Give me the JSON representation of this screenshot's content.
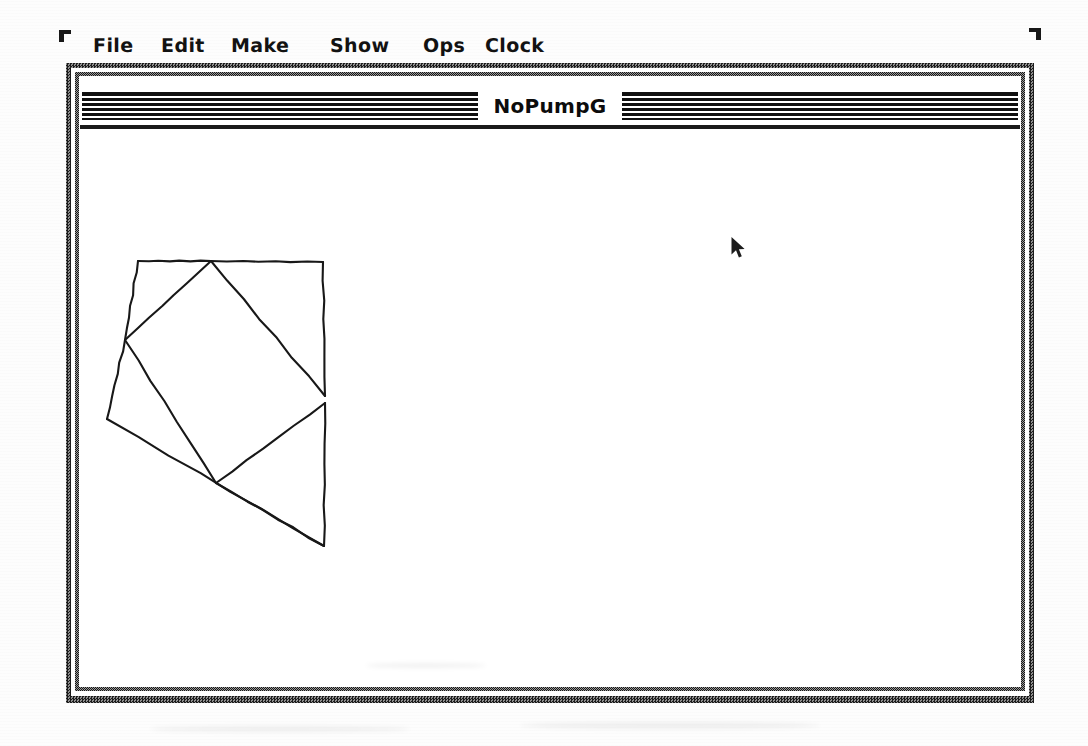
{
  "menubar": {
    "items": [
      {
        "label": "File",
        "x": 93
      },
      {
        "label": "Edit",
        "x": 161
      },
      {
        "label": "Make",
        "x": 231
      },
      {
        "label": "Show",
        "x": 330
      },
      {
        "label": "Ops",
        "x": 423
      },
      {
        "label": "Clock",
        "x": 485
      }
    ]
  },
  "window": {
    "title": "NoPumpG",
    "frame_color": "#2c2c2c",
    "background_color": "#ffffff"
  },
  "cursor": {
    "icon": "arrow-pointer-icon",
    "x": 738,
    "y": 243
  },
  "corner_marks": {
    "top_left": "crop-mark-icon",
    "top_right": "crop-mark-icon"
  },
  "chart_data": {
    "type": "diagram",
    "title": "",
    "stroke_color": "#181818",
    "stroke_width": 2.1,
    "coordinate_space": "canvas pixels, origin at top-left of drawing area",
    "vertices": [
      {
        "id": "A",
        "x": 56,
        "y": 130
      },
      {
        "id": "B",
        "x": 129,
        "y": 130
      },
      {
        "id": "C",
        "x": 241,
        "y": 131
      },
      {
        "id": "D",
        "x": 43,
        "y": 209
      },
      {
        "id": "E",
        "x": 25,
        "y": 288
      },
      {
        "id": "F",
        "x": 243,
        "y": 265
      },
      {
        "id": "G",
        "x": 243,
        "y": 272
      },
      {
        "id": "H",
        "x": 134,
        "y": 352
      },
      {
        "id": "I",
        "x": 242,
        "y": 415
      }
    ],
    "edges": [
      {
        "from": "A",
        "to": "B"
      },
      {
        "from": "B",
        "to": "C"
      },
      {
        "from": "A",
        "to": "D"
      },
      {
        "from": "B",
        "to": "D"
      },
      {
        "from": "B",
        "to": "F"
      },
      {
        "from": "C",
        "to": "F"
      },
      {
        "from": "D",
        "to": "E"
      },
      {
        "from": "D",
        "to": "H"
      },
      {
        "from": "E",
        "to": "I"
      },
      {
        "from": "G",
        "to": "H"
      },
      {
        "from": "G",
        "to": "I"
      },
      {
        "from": "H",
        "to": "I"
      }
    ]
  }
}
